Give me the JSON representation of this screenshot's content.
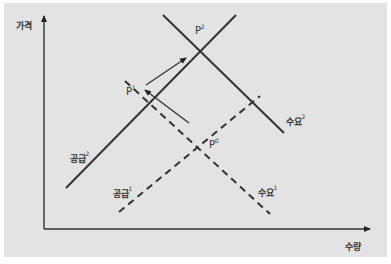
{
  "diagram": {
    "type": "supply-demand",
    "axes": {
      "y_label": "가격",
      "x_label": "수량"
    },
    "curves": [
      {
        "id": "supply2",
        "label": "공급",
        "sup": "2",
        "style": "solid"
      },
      {
        "id": "demand2",
        "label": "수요",
        "sup": "2",
        "style": "solid"
      },
      {
        "id": "supply1",
        "label": "공급",
        "sup": "1",
        "style": "dashed"
      },
      {
        "id": "demand1",
        "label": "수요",
        "sup": "1",
        "style": "dashed"
      }
    ],
    "points": [
      {
        "id": "p2",
        "label": "P",
        "sup": "2"
      },
      {
        "id": "p1",
        "label": "P",
        "sup": "1"
      },
      {
        "id": "p0",
        "label": "P",
        "sup": "0"
      }
    ],
    "colors": {
      "background": "#e3e3e3",
      "line": "#333333"
    }
  }
}
